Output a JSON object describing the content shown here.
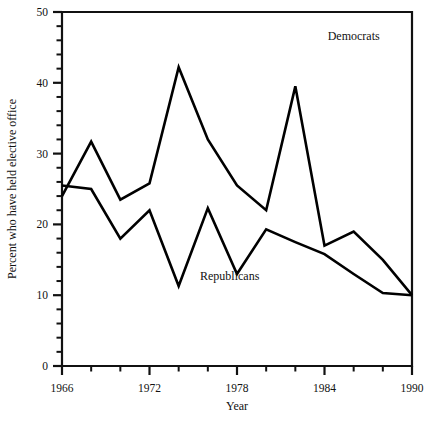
{
  "chart_data": {
    "type": "line",
    "title": "",
    "xlabel": "Year",
    "ylabel": "Percent who have held elective office",
    "x": [
      1966,
      1968,
      1970,
      1972,
      1974,
      1976,
      1978,
      1980,
      1982,
      1984,
      1986,
      1988,
      1990
    ],
    "xlim": [
      1966,
      1990
    ],
    "ylim": [
      0,
      50
    ],
    "grid": false,
    "legend_position": "inline-annotations",
    "x_tick_labels": [
      "1966",
      "1972",
      "1978",
      "1984",
      "1990"
    ],
    "x_ticks_major": [
      1966,
      1972,
      1978,
      1984,
      1990
    ],
    "x_ticks_minor": [
      1968,
      1970,
      1974,
      1976,
      1980,
      1982,
      1986,
      1988
    ],
    "y_tick_labels": [
      "0",
      "10",
      "20",
      "30",
      "40",
      "50"
    ],
    "y_ticks_major": [
      0,
      10,
      20,
      30,
      40,
      50
    ],
    "y_minor_step": 2,
    "series": [
      {
        "name": "Democrats",
        "color": "#000000",
        "values": [
          24.0,
          31.7,
          23.5,
          25.8,
          42.2,
          32.0,
          25.5,
          22.0,
          39.5,
          17.0,
          19.0,
          15.0,
          10.0
        ]
      },
      {
        "name": "Republicans",
        "color": "#000000",
        "values": [
          25.5,
          25.0,
          18.0,
          22.0,
          11.3,
          22.3,
          13.0,
          19.3,
          17.5,
          15.8,
          13.0,
          10.3,
          10.0
        ]
      }
    ],
    "annotations": [
      {
        "text": "Democrats",
        "x": 1986,
        "y": 46.0,
        "name": "democrats-label"
      },
      {
        "text": "Republicans",
        "x": 1977.5,
        "y": 12.2,
        "name": "republicans-label"
      }
    ]
  }
}
